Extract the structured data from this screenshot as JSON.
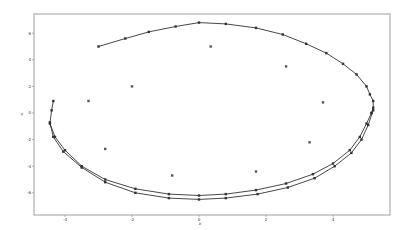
{
  "chart_data": {
    "type": "scatter",
    "title": "",
    "xlabel": "x",
    "ylabel": "y",
    "xlim": [
      -4.9,
      5.7
    ],
    "ylim": [
      -7.7,
      7.4
    ],
    "xticks": [
      -4,
      -2,
      0,
      2,
      4
    ],
    "yticks": [
      -6,
      -4,
      -2,
      0,
      2,
      4,
      6
    ],
    "xtick_labels": [
      "-4",
      "-2",
      "0",
      "2",
      "4"
    ],
    "ytick_labels": [
      "-6",
      "-4",
      "-2",
      "0",
      "2",
      "4",
      "6"
    ],
    "grid": false,
    "legend": null,
    "series": [
      {
        "name": "trajectory-1",
        "style": "line-with-markers",
        "color": "#333333",
        "x": [
          -3.0,
          -2.2,
          -1.5,
          -0.7,
          0.0,
          0.8,
          1.7,
          2.5,
          3.2,
          3.8,
          4.3,
          4.7,
          5.0,
          5.1,
          5.2,
          5.2,
          5.15
        ],
        "y": [
          5.0,
          5.6,
          6.1,
          6.5,
          6.8,
          6.7,
          6.4,
          5.9,
          5.2,
          4.5,
          3.7,
          2.9,
          2.0,
          1.4,
          0.9,
          0.4,
          0.0
        ]
      },
      {
        "name": "trajectory-2",
        "style": "line-with-markers",
        "color": "#333333",
        "x": [
          5.15,
          5.0,
          4.8,
          4.5,
          4.0,
          3.4,
          2.6,
          1.7,
          0.8,
          0.0,
          -0.9,
          -1.9,
          -2.8,
          -3.5,
          -4.0,
          -4.3,
          -4.45,
          -4.4,
          -4.35
        ],
        "y": [
          0.0,
          -0.8,
          -1.8,
          -2.8,
          -3.8,
          -4.6,
          -5.3,
          -5.8,
          -6.1,
          -6.2,
          -6.1,
          -5.7,
          -5.0,
          -4.0,
          -2.8,
          -1.8,
          -0.8,
          0.2,
          0.9
        ]
      },
      {
        "name": "trajectory-3",
        "style": "line-with-markers",
        "color": "#333333",
        "x": [
          5.2,
          5.05,
          4.85,
          4.55,
          4.05,
          3.45,
          2.65,
          1.75,
          0.8,
          0.0,
          -0.9,
          -1.9,
          -2.8,
          -3.5,
          -4.05,
          -4.35,
          -4.45
        ],
        "y": [
          0.2,
          -0.9,
          -2.0,
          -3.0,
          -4.0,
          -4.9,
          -5.6,
          -6.1,
          -6.4,
          -6.5,
          -6.4,
          -6.0,
          -5.2,
          -4.1,
          -2.9,
          -1.8,
          -0.7
        ]
      },
      {
        "name": "scattered-points",
        "style": "markers",
        "color": "#555555",
        "x": [
          0.35,
          -2.0,
          -3.3,
          2.6,
          3.7,
          -2.8,
          -0.8,
          1.7,
          3.3
        ],
        "y": [
          5.0,
          2.0,
          0.9,
          3.5,
          0.8,
          -2.7,
          -4.7,
          -4.4,
          -2.2
        ]
      }
    ]
  }
}
